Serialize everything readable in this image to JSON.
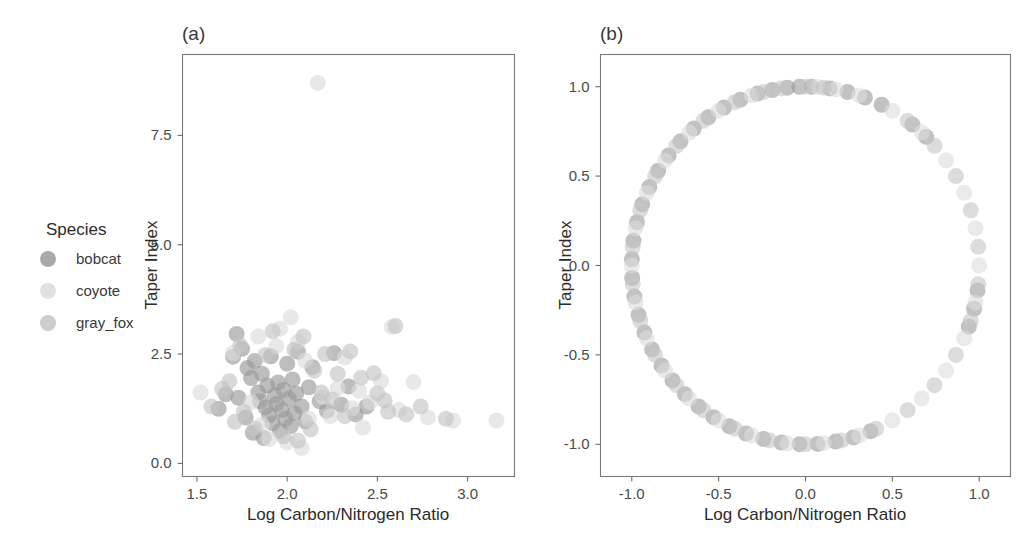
{
  "figure": {
    "background": "#ffffff",
    "axis_color": "#6e6e6e",
    "text_color": "#2b2b2b"
  },
  "legend": {
    "title": "Species",
    "items": [
      {
        "label": "bobcat",
        "color": "#9a9a9a",
        "opacity": 0.85
      },
      {
        "label": "coyote",
        "color": "#dcdcdc",
        "opacity": 0.85
      },
      {
        "label": "gray_fox",
        "color": "#c4c4c4",
        "opacity": 0.85
      }
    ]
  },
  "panels": [
    {
      "tag": "(a)",
      "xlabel": "Log Carbon/Nitrogen Ratio",
      "ylabel": "Taper Index",
      "xticks": [
        1.5,
        2.0,
        2.5,
        3.0
      ],
      "xtick_labels": [
        "1.5",
        "2.0",
        "2.5",
        "3.0"
      ],
      "yticks": [
        0.0,
        2.5,
        5.0,
        7.5
      ],
      "ytick_labels": [
        "0.0",
        "2.5",
        "5.0",
        "7.5"
      ],
      "xlim": [
        1.42,
        3.26
      ],
      "ylim": [
        -0.3,
        9.35
      ]
    },
    {
      "tag": "(b)",
      "xlabel": "Log Carbon/Nitrogen Ratio",
      "ylabel": "Taper Index",
      "xticks": [
        -1.0,
        -0.5,
        0.0,
        0.5,
        1.0
      ],
      "xtick_labels": [
        "-1.0",
        "-0.5",
        "0.0",
        "0.5",
        "1.0"
      ],
      "yticks": [
        -1.0,
        -0.5,
        0.0,
        0.5,
        1.0
      ],
      "ytick_labels": [
        "-1.0",
        "-0.5",
        "0.0",
        "0.5",
        "1.0"
      ],
      "xlim": [
        -1.18,
        1.18
      ],
      "ylim": [
        -1.18,
        1.18
      ]
    }
  ],
  "chart_data": [
    {
      "type": "scatter",
      "panel": "(a)",
      "title": "(a)",
      "xlabel": "Log Carbon/Nitrogen Ratio",
      "ylabel": "Taper Index",
      "xlim": [
        1.42,
        3.26
      ],
      "ylim": [
        -0.3,
        9.35
      ],
      "grid": false,
      "legend_position": "left-outside",
      "marker_radius_px": 8,
      "marker_opacity": 0.65,
      "series": [
        {
          "name": "bobcat",
          "color": "#9a9a9a",
          "points": [
            [
              1.72,
              2.96
            ],
            [
              1.75,
              2.62
            ],
            [
              1.78,
              2.18
            ],
            [
              1.8,
              1.95
            ],
            [
              1.82,
              2.34
            ],
            [
              1.84,
              1.62
            ],
            [
              1.85,
              1.42
            ],
            [
              1.86,
              2.05
            ],
            [
              1.88,
              1.28
            ],
            [
              1.89,
              1.78
            ],
            [
              1.9,
              1.1
            ],
            [
              1.91,
              2.45
            ],
            [
              1.92,
              0.92
            ],
            [
              1.93,
              1.55
            ],
            [
              1.94,
              1.36
            ],
            [
              1.95,
              1.85
            ],
            [
              1.96,
              0.74
            ],
            [
              1.97,
              1.22
            ],
            [
              1.98,
              1.68
            ],
            [
              1.99,
              1.02
            ],
            [
              2.0,
              2.28
            ],
            [
              2.01,
              1.48
            ],
            [
              2.02,
              0.85
            ],
            [
              2.03,
              1.92
            ],
            [
              2.04,
              1.15
            ],
            [
              2.05,
              1.6
            ],
            [
              2.06,
              2.55
            ],
            [
              2.08,
              1.3
            ],
            [
              2.1,
              0.96
            ],
            [
              2.12,
              1.74
            ],
            [
              1.7,
              2.44
            ],
            [
              1.73,
              1.5
            ],
            [
              1.77,
              1.05
            ],
            [
              1.81,
              0.7
            ],
            [
              1.87,
              0.58
            ],
            [
              2.14,
              2.2
            ],
            [
              2.18,
              1.42
            ],
            [
              2.22,
              1.2
            ],
            [
              2.26,
              2.52
            ],
            [
              2.3,
              1.34
            ],
            [
              1.62,
              1.25
            ],
            [
              1.66,
              1.58
            ],
            [
              2.34,
              1.76
            ],
            [
              2.38,
              1.12
            ],
            [
              2.44,
              1.3
            ]
          ]
        },
        {
          "name": "coyote",
          "color": "#dcdcdc",
          "points": [
            [
              1.52,
              1.62
            ],
            [
              1.7,
              2.52
            ],
            [
              1.84,
              2.9
            ],
            [
              1.96,
              3.08
            ],
            [
              2.02,
              3.34
            ],
            [
              2.06,
              2.78
            ],
            [
              2.1,
              2.35
            ],
            [
              2.17,
              8.7
            ],
            [
              2.2,
              1.52
            ],
            [
              2.24,
              1.08
            ],
            [
              2.28,
              1.72
            ],
            [
              2.32,
              2.42
            ],
            [
              2.36,
              1.26
            ],
            [
              2.4,
              1.66
            ],
            [
              2.46,
              1.4
            ],
            [
              2.52,
              1.88
            ],
            [
              2.58,
              3.12
            ],
            [
              2.62,
              1.22
            ],
            [
              2.7,
              1.86
            ],
            [
              2.78,
              1.05
            ],
            [
              2.92,
              0.98
            ],
            [
              3.16,
              0.98
            ],
            [
              1.9,
              0.56
            ],
            [
              2.0,
              0.48
            ],
            [
              2.08,
              0.35
            ],
            [
              1.8,
              1.4
            ],
            [
              1.86,
              0.88
            ],
            [
              1.94,
              2.68
            ],
            [
              2.12,
              1.02
            ],
            [
              2.42,
              0.82
            ]
          ]
        },
        {
          "name": "gray_fox",
          "color": "#c4c4c4",
          "points": [
            [
              1.58,
              1.3
            ],
            [
              1.74,
              2.7
            ],
            [
              1.88,
              2.48
            ],
            [
              1.92,
              3.02
            ],
            [
              2.04,
              2.6
            ],
            [
              2.15,
              2.12
            ],
            [
              2.21,
              2.5
            ],
            [
              2.28,
              2.05
            ],
            [
              2.35,
              2.56
            ],
            [
              2.41,
              1.96
            ],
            [
              2.5,
              1.6
            ],
            [
              2.56,
              1.18
            ],
            [
              2.6,
              3.14
            ],
            [
              2.66,
              1.12
            ],
            [
              2.74,
              1.3
            ],
            [
              2.88,
              1.02
            ],
            [
              1.68,
              1.88
            ],
            [
              1.76,
              1.18
            ],
            [
              1.82,
              0.8
            ],
            [
              1.98,
              0.62
            ],
            [
              2.06,
              0.52
            ],
            [
              2.13,
              0.78
            ],
            [
              2.19,
              1.62
            ],
            [
              2.25,
              1.46
            ],
            [
              2.32,
              1.08
            ],
            [
              2.48,
              2.06
            ],
            [
              2.54,
              1.44
            ],
            [
              1.64,
              1.7
            ],
            [
              1.71,
              0.95
            ],
            [
              2.09,
              2.9
            ]
          ]
        }
      ]
    },
    {
      "type": "scatter",
      "panel": "(b)",
      "title": "(b)",
      "xlabel": "Log Carbon/Nitrogen Ratio",
      "ylabel": "Taper Index",
      "xlim": [
        -1.18,
        1.18
      ],
      "ylim": [
        -1.18,
        1.18
      ],
      "grid": false,
      "shape": "unit-circle",
      "marker_radius_px": 8,
      "marker_opacity": 0.6,
      "note": "All points lie on the unit circle x^2 + y^2 = 1",
      "series": [
        {
          "name": "bobcat",
          "color": "#9a9a9a",
          "angles_deg": [
            92,
            96,
            101,
            106,
            112,
            118,
            124,
            130,
            136,
            142,
            148,
            154,
            160,
            166,
            172,
            178,
            184,
            190,
            196,
            202,
            208,
            214,
            220,
            226,
            232,
            238,
            244,
            250,
            256,
            262,
            268,
            274,
            280,
            286,
            292,
            64,
            70,
            76,
            82,
            88,
            -8,
            -14,
            -20,
            46,
            52
          ]
        },
        {
          "name": "coyote",
          "color": "#dcdcdc",
          "angles_deg": [
            80,
            86,
            108,
            120,
            132,
            144,
            156,
            168,
            180,
            192,
            204,
            216,
            228,
            240,
            252,
            264,
            276,
            288,
            300,
            312,
            324,
            336,
            348,
            0,
            12,
            24,
            36,
            48,
            60,
            72
          ]
        },
        {
          "name": "gray_fox",
          "color": "#c4c4c4",
          "angles_deg": [
            84,
            90,
            98,
            104,
            114,
            126,
            138,
            150,
            162,
            174,
            186,
            198,
            210,
            222,
            234,
            246,
            258,
            270,
            282,
            294,
            306,
            318,
            330,
            342,
            354,
            6,
            18,
            30,
            42,
            54
          ]
        }
      ]
    }
  ]
}
